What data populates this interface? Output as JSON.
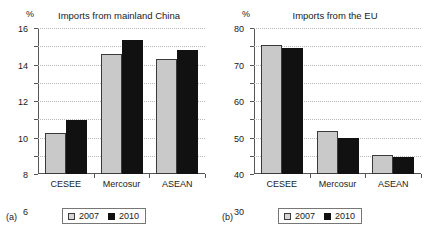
{
  "figure": {
    "series_colors": {
      "s2007": "#c9c9c9",
      "s2010": "#111111"
    },
    "grid": "horizontal dotted",
    "legend_position": "below axis, centered"
  },
  "panels": [
    {
      "tag": "(a)",
      "title": "Imports from mainland China",
      "unit": "%",
      "ylabels": [
        "0",
        "2",
        "4",
        "6",
        "8",
        "10",
        "12",
        "14",
        "16"
      ],
      "xlabels": [
        "CESEE",
        "Mercosur",
        "ASEAN"
      ],
      "legend": [
        {
          "label": "2007",
          "key": "s2007"
        },
        {
          "label": "2010",
          "key": "s2010"
        }
      ],
      "chart_data": {
        "type": "bar",
        "title": "Imports from mainland China",
        "xlabel": "",
        "ylabel": "%",
        "ylim": [
          0,
          16
        ],
        "yticks": [
          0,
          2,
          4,
          6,
          8,
          10,
          12,
          14,
          16
        ],
        "grid": true,
        "legend_position": "bottom",
        "categories": [
          "CESEE",
          "Mercosur",
          "ASEAN"
        ],
        "series": [
          {
            "name": "2007",
            "values": [
              4.5,
              13.2,
              12.6
            ]
          },
          {
            "name": "2010",
            "values": [
              5.95,
              14.7,
              13.6
            ]
          }
        ]
      }
    },
    {
      "tag": "(b)",
      "title": "Imports from the EU",
      "unit": "%",
      "ylabels": [
        "0",
        "10",
        "20",
        "30",
        "40",
        "50",
        "60",
        "70",
        "80"
      ],
      "xlabels": [
        "CESEE",
        "Mercosur",
        "ASEAN"
      ],
      "legend": [
        {
          "label": "2007",
          "key": "s2007"
        },
        {
          "label": "2010",
          "key": "s2010"
        }
      ],
      "chart_data": {
        "type": "bar",
        "title": "Imports from the EU",
        "xlabel": "",
        "ylabel": "%",
        "ylim": [
          0,
          80
        ],
        "yticks": [
          0,
          10,
          20,
          30,
          40,
          50,
          60,
          70,
          80
        ],
        "grid": true,
        "legend_position": "bottom",
        "categories": [
          "CESEE",
          "Mercosur",
          "ASEAN"
        ],
        "series": [
          {
            "name": "2007",
            "values": [
              70.5,
              23.5,
              10.6
            ]
          },
          {
            "name": "2010",
            "values": [
              68.8,
              19.7,
              9.3
            ]
          }
        ]
      }
    }
  ]
}
